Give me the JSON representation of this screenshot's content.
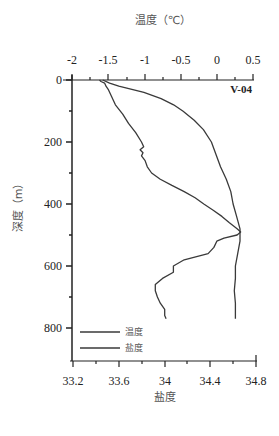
{
  "chart_data": {
    "type": "line",
    "title": "",
    "station_label": "V-04",
    "top_axis": {
      "label": "温度（℃）",
      "ticks": [
        "-2",
        "-1.5",
        "-1",
        "-0.5",
        "0",
        "0.5"
      ],
      "tick_values": [
        -2,
        -1.5,
        -1,
        -0.5,
        0,
        0.5
      ],
      "range": [
        -2,
        0.5
      ]
    },
    "bottom_axis": {
      "label": "盐度",
      "ticks": [
        "33.2",
        "33.6",
        "34",
        "34.4",
        "34.8"
      ],
      "tick_values": [
        33.2,
        33.6,
        34.0,
        34.4,
        34.8
      ],
      "range": [
        33.2,
        34.8
      ]
    },
    "y_axis": {
      "label": "深度（m）",
      "ticks": [
        "0",
        "200",
        "400",
        "600",
        "800"
      ],
      "tick_values": [
        0,
        200,
        400,
        600,
        800
      ],
      "range": [
        0,
        900
      ],
      "inverted": true
    },
    "legend": [
      {
        "name": "温度"
      },
      {
        "name": "盐度"
      }
    ],
    "series": [
      {
        "name": "温度",
        "axis": "top",
        "depth": [
          0,
          5,
          10,
          20,
          30,
          50,
          80,
          110,
          140,
          170,
          200,
          215,
          225,
          235,
          245,
          260,
          280,
          300,
          320,
          340,
          360,
          380,
          400,
          420,
          440,
          460,
          480,
          490,
          500,
          510,
          520,
          540,
          560,
          580,
          600,
          620,
          640,
          660,
          680,
          700,
          720,
          740,
          760,
          770
        ],
        "values": [
          -1.62,
          -1.6,
          -1.55,
          -1.53,
          -1.5,
          -1.46,
          -1.4,
          -1.3,
          -1.22,
          -1.12,
          -1.04,
          -1.01,
          -1.06,
          -1.02,
          -1.04,
          -0.99,
          -0.96,
          -0.9,
          -0.78,
          -0.62,
          -0.45,
          -0.3,
          -0.18,
          -0.05,
          0.07,
          0.17,
          0.28,
          0.33,
          0.28,
          0.1,
          0.0,
          -0.04,
          -0.12,
          -0.45,
          -0.6,
          -0.6,
          -0.75,
          -0.85,
          -0.85,
          -0.82,
          -0.78,
          -0.72,
          -0.72,
          -0.7
        ]
      },
      {
        "name": "盐度",
        "axis": "bottom",
        "depth": [
          0,
          10,
          20,
          40,
          60,
          80,
          100,
          130,
          160,
          200,
          240,
          280,
          320,
          360,
          400,
          440,
          480,
          520,
          560,
          600,
          640,
          680,
          720,
          770
        ],
        "values": [
          33.46,
          33.52,
          33.6,
          33.82,
          33.97,
          34.08,
          34.16,
          34.26,
          34.34,
          34.41,
          34.45,
          34.49,
          34.54,
          34.58,
          34.6,
          34.63,
          34.66,
          34.66,
          34.64,
          34.62,
          34.62,
          34.61,
          34.62,
          34.62
        ]
      }
    ],
    "grid": false,
    "legend_position": "lower-left inside"
  }
}
